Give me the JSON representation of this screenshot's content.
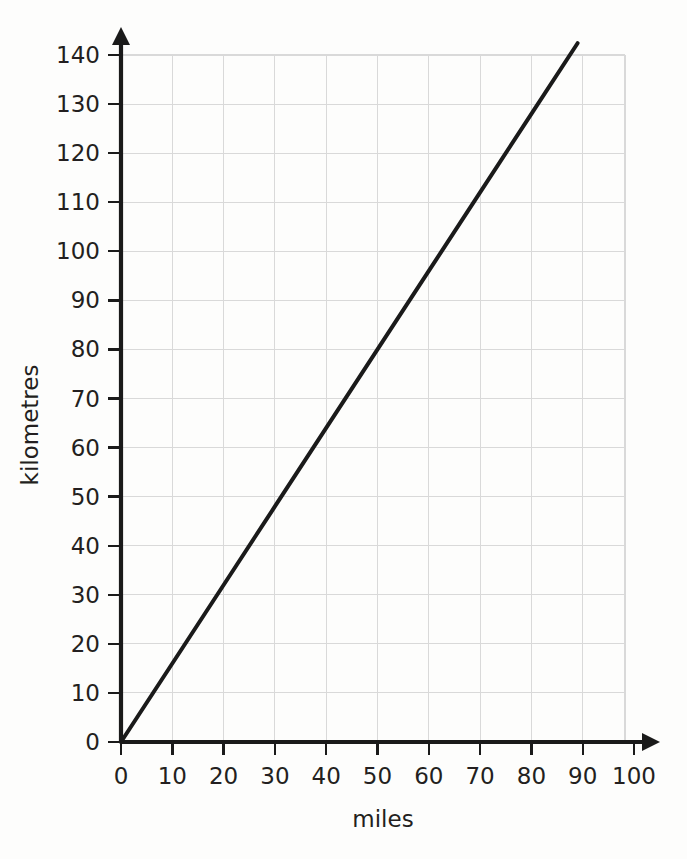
{
  "chart_data": {
    "type": "line",
    "title": "",
    "subtitle": "",
    "xlabel": "miles",
    "ylabel": "kilometres",
    "xlim": [
      0,
      100
    ],
    "ylim": [
      0,
      140
    ],
    "x_ticks": [
      0,
      10,
      20,
      30,
      40,
      50,
      60,
      70,
      80,
      90,
      100
    ],
    "y_ticks": [
      0,
      10,
      20,
      30,
      40,
      50,
      60,
      70,
      80,
      90,
      100,
      110,
      120,
      130,
      140
    ],
    "x_tick_labels": [
      "0",
      "10",
      "20",
      "30",
      "40",
      "50",
      "60",
      "70",
      "80",
      "90",
      "100"
    ],
    "y_tick_labels": [
      "0",
      "10",
      "20",
      "30",
      "40",
      "50",
      "60",
      "70",
      "80",
      "90",
      "100",
      "110",
      "120",
      "130",
      "140"
    ],
    "grid": true,
    "grid_color": "#d9d9d9",
    "legend": null,
    "legend_position": "none",
    "line_color": "#1a1a1a",
    "axis_color": "#1a1a1a",
    "background_color": "#fdfdfc",
    "series": [
      {
        "name": "miles to kilometres conversion",
        "slope_km_per_mile": 1.6,
        "x": [
          0,
          10,
          20,
          30,
          40,
          50,
          60,
          70,
          80,
          89
        ],
        "values": [
          0,
          16,
          32,
          48,
          64,
          80,
          96,
          112,
          128,
          142.4
        ]
      }
    ],
    "annotations": []
  },
  "axes": {
    "x_axis_arrow": true,
    "y_axis_arrow": true,
    "x_title": "miles",
    "y_title": "kilometres"
  }
}
